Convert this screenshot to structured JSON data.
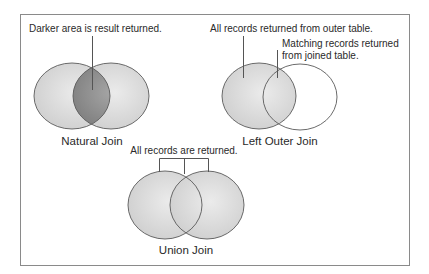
{
  "colors": {
    "frame": "#8a8a8a",
    "circle_stroke": "#5a5a5a",
    "light_fill": "#dcdcdc",
    "dark_fill": "#8f8f8f",
    "empty_fill": "#ffffff",
    "leader": "#555555",
    "text": "#2a2a2a"
  },
  "diagrams": {
    "natural_join": {
      "title": "Natural Join",
      "note": "Darker area is result returned."
    },
    "left_outer_join": {
      "title": "Left Outer Join",
      "note_outer": "All records returned from outer table.",
      "note_matching_line1": "Matching records returned",
      "note_matching_line2": "from joined table."
    },
    "union_join": {
      "title": "Union Join",
      "note": "All records are returned."
    }
  }
}
